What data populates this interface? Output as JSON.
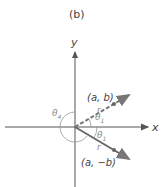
{
  "figure": {
    "panel_label": "(b)",
    "axes": {
      "x_label": "x",
      "y_label": "y"
    },
    "points": [
      {
        "label": "(a, b)",
        "style": "dashed"
      },
      {
        "label": "(a, −b)",
        "style": "solid"
      }
    ],
    "radius_label": "r",
    "angles": {
      "theta1": "θ",
      "theta1_sub": "1",
      "theta4": "θ",
      "theta4_sub": "4"
    },
    "colors": {
      "axis": "#555555",
      "vector": "#666666",
      "arc": "#999999",
      "text": "#444444"
    }
  }
}
